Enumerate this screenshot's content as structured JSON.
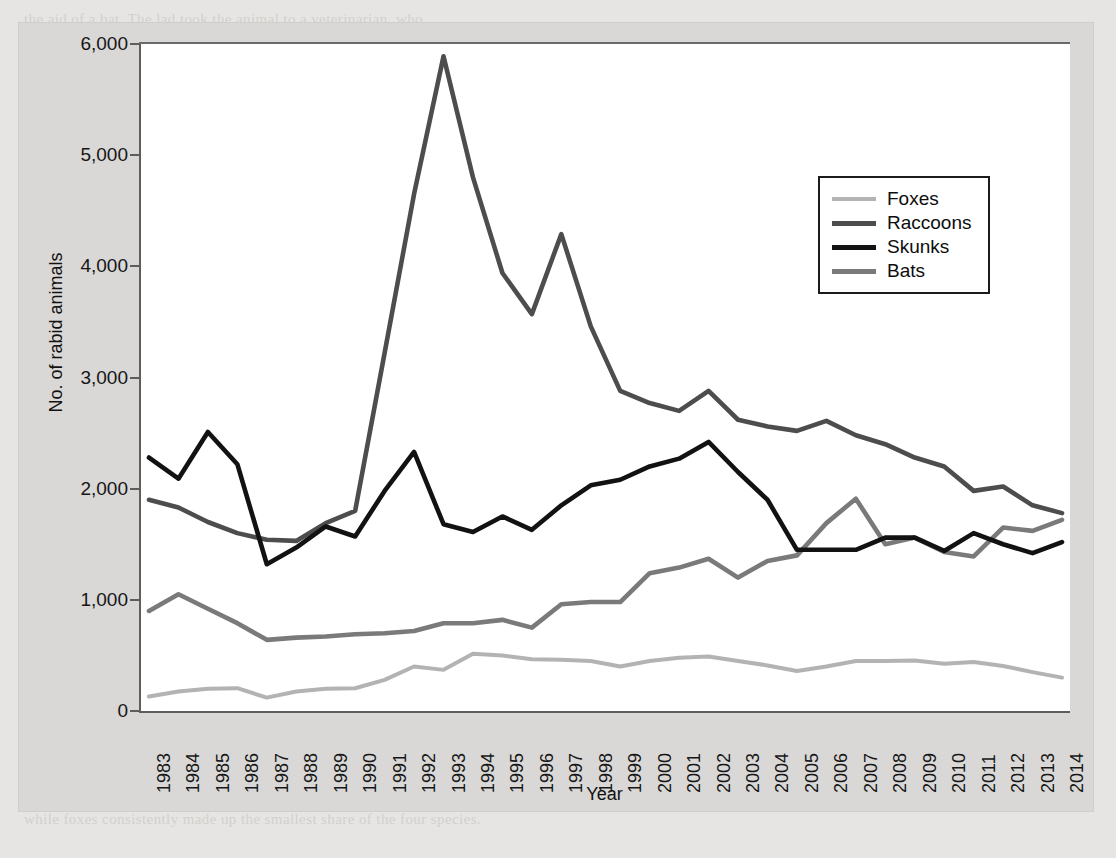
{
  "figure": {
    "background_color": "#d9d8d6",
    "plot_background_color": "#ffffff",
    "axis_color": "#5d5d5d"
  },
  "ghost_lines": [
    "the aid of a bat. The lad took the animal to a veterinarian, who",
    "determined that the bat was rabid. The boy received a series of rabies",
    "vaccine injections. In this chapter we examine the epidemiology of rabies",
    "in the United States. The CDC gathers and analyzes surveillance data on",
    "rabies in both wild and domesticated animal populations, as well as in",
    "humans. The reports are published annually in a journal.",
    "Rabies is a viral disease of mammals that is most often transmitted",
    "through the bite of a rabid animal. The vast majority of rabies cases",
    "reported to the CDC each year occur in wild animals like raccoons,",
    "skunks, bats, and foxes. Domestic animals account for less than 10%",
    "of all reported cases of rabies. Rabies is almost always fatal once",
    "symptoms appear, but it is entirely preventable. Since the 1960s the",
    "number of reported cases in the United States has dropped dramatically.",
    "Most human cases in the U.S. are now attributable to bat variants.",
    "The most recent nationwide survey and the data from the last year",
    "reveal which animals remain the primary reservoirs for the virus.",
    "Between 2008 and 2014 the number of cases in raccoons declined,",
    "though raccoons still accounted for about one third of all cases.",
    "Skunks were the second most frequently reported rabid wildlife species.",
    "Bats accounted for a growing share of reported animal rabies cases,",
    "while foxes consistently made up the smallest share of the four species."
  ],
  "chart_data": {
    "type": "line",
    "title": "",
    "xlabel": "Year",
    "ylabel": "No. of rabid animals",
    "ylim": [
      0,
      6000
    ],
    "yticks": [
      0,
      1000,
      2000,
      3000,
      4000,
      5000,
      6000
    ],
    "ytick_labels": [
      "0",
      "1,000",
      "2,000",
      "3,000",
      "4,000",
      "5,000",
      "6,000"
    ],
    "grid": false,
    "legend_position": "upper right",
    "categories": [
      "1983",
      "1984",
      "1985",
      "1986",
      "1987",
      "1988",
      "1989",
      "1990",
      "1991",
      "1992",
      "1993",
      "1994",
      "1995",
      "1996",
      "1997",
      "1998",
      "1999",
      "2000",
      "2001",
      "2002",
      "2003",
      "2004",
      "2005",
      "2006",
      "2007",
      "2008",
      "2009",
      "2010",
      "2011",
      "2012",
      "2013",
      "2014"
    ],
    "series": [
      {
        "name": "Foxes",
        "color": "#b3b3b3",
        "values": [
          130,
          175,
          200,
          205,
          120,
          175,
          200,
          205,
          280,
          400,
          370,
          515,
          500,
          465,
          460,
          450,
          400,
          450,
          480,
          490,
          450,
          410,
          360,
          400,
          450,
          450,
          455,
          425,
          440,
          405,
          350,
          300
        ]
      },
      {
        "name": "Raccoons",
        "color": "#4d4d4d",
        "values": [
          1900,
          1830,
          1700,
          1600,
          1540,
          1530,
          1690,
          1800,
          3220,
          4650,
          5890,
          4800,
          3940,
          3570,
          4290,
          3460,
          2880,
          2770,
          2700,
          2880,
          2620,
          2560,
          2520,
          2610,
          2480,
          2400,
          2280,
          2200,
          1980,
          2020,
          1850,
          1780
        ]
      },
      {
        "name": "Skunks",
        "color": "#121212",
        "values": [
          2280,
          2090,
          2510,
          2220,
          1320,
          1470,
          1660,
          1570,
          1980,
          2330,
          1680,
          1610,
          1750,
          1630,
          1850,
          2030,
          2080,
          2200,
          2270,
          2420,
          2150,
          1900,
          1450,
          1450,
          1450,
          1560,
          1560,
          1440,
          1600,
          1500,
          1420,
          1520
        ]
      },
      {
        "name": "Bats",
        "color": "#7a7a7a",
        "values": [
          900,
          1050,
          920,
          790,
          640,
          660,
          670,
          690,
          700,
          720,
          790,
          790,
          820,
          750,
          960,
          980,
          980,
          1240,
          1290,
          1370,
          1200,
          1350,
          1400,
          1690,
          1910,
          1500,
          1560,
          1430,
          1390,
          1650,
          1620,
          1720
        ]
      }
    ]
  },
  "legend": {
    "items": [
      {
        "label": "Foxes",
        "color": "#b3b3b3",
        "thickness": 4
      },
      {
        "label": "Raccoons",
        "color": "#4d4d4d",
        "thickness": 5
      },
      {
        "label": "Skunks",
        "color": "#121212",
        "thickness": 5
      },
      {
        "label": "Bats",
        "color": "#7a7a7a",
        "thickness": 5
      }
    ]
  }
}
